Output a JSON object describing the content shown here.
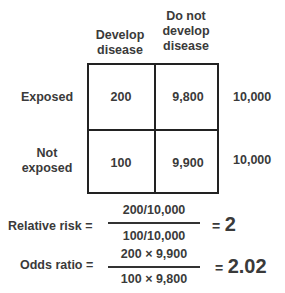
{
  "table": {
    "column_headers": [
      {
        "lines": [
          "Develop",
          "disease"
        ]
      },
      {
        "lines": [
          "Do not",
          "develop",
          "disease"
        ]
      }
    ],
    "rows": [
      {
        "label_lines": [
          "Exposed"
        ],
        "develop_disease": "200",
        "do_not_develop": "9,800",
        "total": "10,000"
      },
      {
        "label_lines": [
          "Not",
          "exposed"
        ],
        "develop_disease": "100",
        "do_not_develop": "9,900",
        "total": "10,000"
      }
    ]
  },
  "formulas": {
    "relative_risk": {
      "label": "Relative risk =",
      "numerator": "200/10,000",
      "denominator": "100/10,000",
      "equals": "=",
      "result": "2"
    },
    "odds_ratio": {
      "label": "Odds ratio =",
      "numerator": "200 × 9,900",
      "denominator": "100 × 9,800",
      "equals": "=",
      "result": "2.02"
    }
  }
}
